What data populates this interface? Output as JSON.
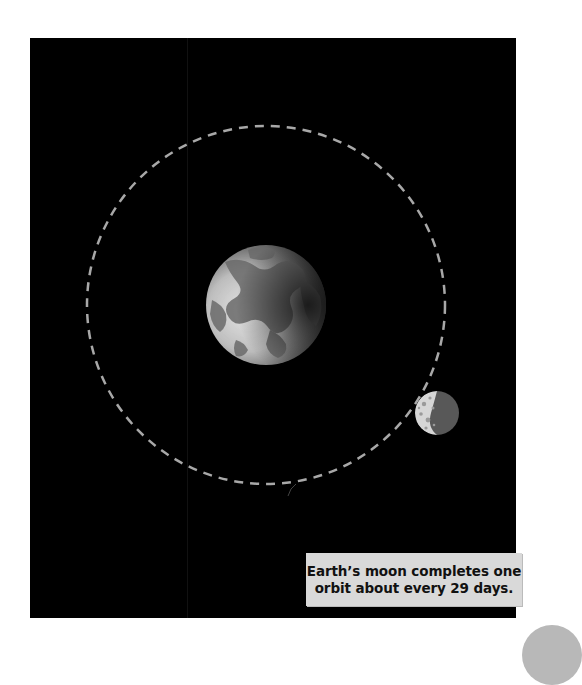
{
  "figure": {
    "background_color": "#000000",
    "orbit": {
      "style": "dashed",
      "color": "#aaaaaa",
      "center": [
        266,
        305
      ],
      "radius": 179
    },
    "earth": {
      "label": "Earth",
      "icon": "earth-icon",
      "center": [
        266,
        305
      ],
      "radius": 60
    },
    "moon": {
      "label": "Moon",
      "icon": "moon-icon",
      "center": [
        437,
        413
      ],
      "radius": 22
    }
  },
  "caption": {
    "line1": "Earth’s moon completes one",
    "line2": "orbit about every 29 days."
  }
}
